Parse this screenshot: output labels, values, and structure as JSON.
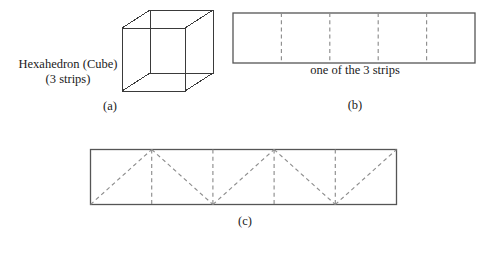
{
  "figure": {
    "background_color": "#ffffff",
    "line_color": "#3a3a3a",
    "dash_color": "#8e8e8e",
    "outline_color": "#555555"
  },
  "panel_a": {
    "label_line1": "Hexahedron (Cube)",
    "label_line2": "(3 strips)",
    "caption": "(a)",
    "shape_name": "cube-wireframe",
    "edge_count": 12,
    "vertex_count": 8
  },
  "panel_b": {
    "caption": "(b)",
    "note": "one of the 3 strips",
    "cells": 5,
    "fold_lines": 4,
    "shape_name": "unfolded-strip"
  },
  "panel_c": {
    "caption": "(c)",
    "cells": 5,
    "fold_lines": 4,
    "diagonal_lines": 5,
    "shape_name": "triangle-zigzag-strip"
  }
}
